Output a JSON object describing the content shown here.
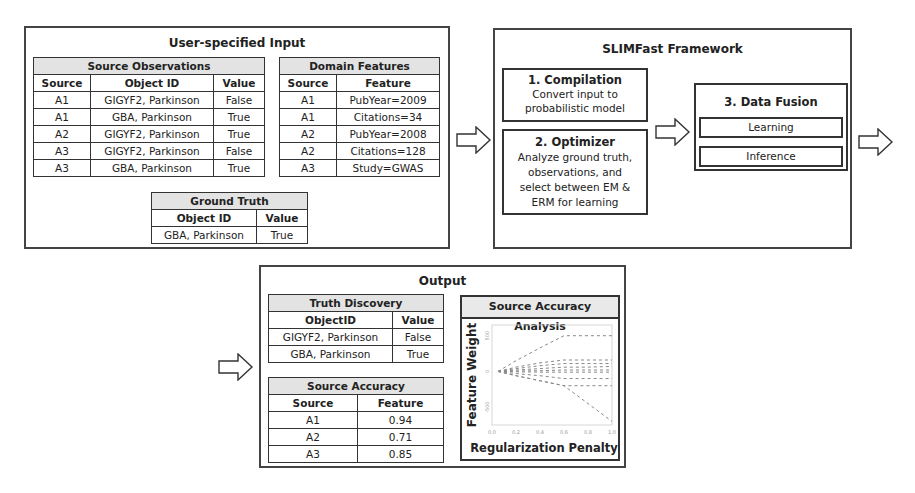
{
  "input": {
    "title": "User-specified Input",
    "source_observations": {
      "caption": "Source Observations",
      "headers": [
        "Source",
        "Object ID",
        "Value"
      ],
      "rows": [
        [
          "A1",
          "GIGYF2, Parkinson",
          "False"
        ],
        [
          "A1",
          "GBA, Parkinson",
          "True"
        ],
        [
          "A2",
          "GIGYF2, Parkinson",
          "True"
        ],
        [
          "A3",
          "GIGYF2, Parkinson",
          "False"
        ],
        [
          "A3",
          "GBA, Parkinson",
          "True"
        ]
      ]
    },
    "domain_features": {
      "caption": "Domain Features",
      "headers": [
        "Source",
        "Feature"
      ],
      "rows": [
        [
          "A1",
          "PubYear=2009"
        ],
        [
          "A1",
          "Citations=34"
        ],
        [
          "A2",
          "PubYear=2008"
        ],
        [
          "A2",
          "Citations=128"
        ],
        [
          "A3",
          "Study=GWAS"
        ]
      ]
    },
    "ground_truth": {
      "caption": "Ground Truth",
      "headers": [
        "Object ID",
        "Value"
      ],
      "rows": [
        [
          "GBA, Parkinson",
          "True"
        ]
      ]
    }
  },
  "framework": {
    "title": "SLIMFast Framework",
    "compilation": {
      "heading": "1. Compilation",
      "lines": [
        "Convert input to",
        "probabilistic model"
      ]
    },
    "optimizer": {
      "heading": "2. Optimizer",
      "lines": [
        "Analyze ground truth,",
        "observations, and",
        "select between EM &",
        "ERM for learning"
      ]
    },
    "data_fusion": {
      "heading": "3. Data Fusion",
      "items": [
        "Learning",
        "Inference"
      ]
    }
  },
  "output": {
    "title": "Output",
    "truth_discovery": {
      "caption": "Truth Discovery",
      "headers": [
        "ObjectID",
        "Value"
      ],
      "rows": [
        [
          "GIGYF2, Parkinson",
          "False"
        ],
        [
          "GBA, Parkinson",
          "True"
        ]
      ]
    },
    "source_accuracy": {
      "caption": "Source Accuracy",
      "headers": [
        "Source",
        "Feature"
      ],
      "rows": [
        [
          "A1",
          "0.94"
        ],
        [
          "A2",
          "0.71"
        ],
        [
          "A3",
          "0.85"
        ]
      ]
    },
    "analysis": {
      "title": "Source Accuracy Analysis",
      "ylabel": "Feature Weight",
      "xlabel": "Regularization Penalty"
    }
  },
  "chart_data": {
    "type": "line",
    "title": "Source Accuracy Analysis",
    "xlabel": "Regularization Penalty",
    "ylabel": "Feature Weight",
    "x": [
      0.05,
      0.2,
      0.4,
      0.6,
      0.8,
      1.0
    ],
    "xticks": [
      "0.0",
      "0.2",
      "0.4",
      "0.6",
      "0.8",
      "1.0"
    ],
    "yticks": [
      "-500",
      "0",
      "500"
    ],
    "grid": false,
    "series": [
      {
        "name": "path1",
        "values": [
          0,
          150,
          330,
          500,
          500,
          500
        ]
      },
      {
        "name": "path2",
        "values": [
          0,
          60,
          120,
          160,
          160,
          160
        ]
      },
      {
        "name": "path3",
        "values": [
          0,
          40,
          80,
          110,
          110,
          110
        ]
      },
      {
        "name": "path4",
        "values": [
          0,
          20,
          40,
          60,
          60,
          70
        ]
      },
      {
        "name": "path5",
        "values": [
          0,
          5,
          10,
          20,
          20,
          20
        ]
      },
      {
        "name": "path6",
        "values": [
          0,
          -5,
          -10,
          -10,
          -10,
          -10
        ]
      },
      {
        "name": "path7",
        "values": [
          0,
          -30,
          -60,
          -100,
          -100,
          -100
        ]
      },
      {
        "name": "path8",
        "values": [
          0,
          -60,
          -130,
          -200,
          -200,
          -200
        ]
      },
      {
        "name": "path9",
        "values": [
          0,
          -60,
          -130,
          -200,
          -450,
          -700
        ]
      }
    ],
    "ylim": [
      -750,
      650
    ]
  },
  "colors": {
    "border": "#444444",
    "caption_bg": "#e3e3e3",
    "line": "#888888"
  }
}
